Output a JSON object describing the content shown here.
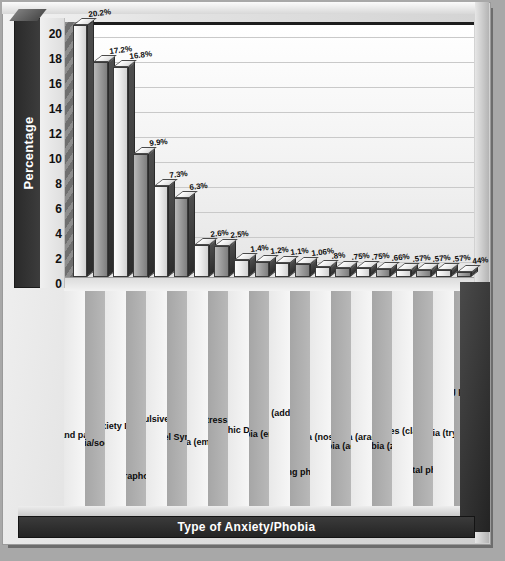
{
  "chart_data": {
    "type": "bar",
    "title": "",
    "xlabel": "Type of Anxiety/Phobia",
    "ylabel": "Percentage",
    "ylim": [
      0,
      21
    ],
    "yticks": [
      0,
      2,
      4,
      6,
      8,
      10,
      12,
      14,
      16,
      18,
      20
    ],
    "grid": true,
    "legend": "none",
    "categories": [
      "Panic attack and panic disorder",
      "Social phobia/social anxiety",
      "Generalized Anxiety Disorder (GAD)",
      "Agoraphobia",
      "Obsessive Compulsive Disorder (OCD)",
      "Irritable Bowel Syndrome (IBS)",
      "Vomit phobia (emetophobia)",
      "Post-Traumatic Stress Disorder (PTSD)",
      "Body Dysmorphic Disorder (BDD)",
      "Blushing phobia (erythrophobia)",
      "Tranquilizer issues (addiction/withdrawal)",
      "Driving phobia",
      "Illness phobia (nosemaphobia)",
      "Flying phobia (aerophobia)",
      "Spider phobia (arachnophobia)",
      "Animal phobia (zoophobia)",
      "Confined spaces (claustrophobia)",
      "Hospital phobia",
      "Injection phobia (trypanophobia)",
      "Choking and swallowing phobia (globus hystericus)"
    ],
    "values": [
      20.2,
      17.2,
      16.8,
      9.9,
      7.3,
      6.3,
      2.6,
      2.5,
      1.4,
      1.2,
      1.1,
      1.06,
      0.8,
      0.75,
      0.75,
      0.66,
      0.57,
      0.57,
      0.57,
      0.44
    ],
    "value_labels": [
      "20.2%",
      "17.2%",
      "16.8%",
      "9.9%",
      "7.3%",
      "6.3%",
      "2.6%",
      "2.5%",
      "1.4%",
      "1.2%",
      "1.1%",
      "1.06%",
      ".8%",
      ".75%",
      ".75%",
      ".66%",
      ".57%",
      ".57%",
      ".57%",
      "44%"
    ]
  },
  "colors": {
    "background": "#a8a8a8",
    "frame": "#e2e2e2",
    "axis_strip": "#2a2a2a",
    "bar_light": "#ededed",
    "bar_dark": "#9d9d9d",
    "text": "#0d0d0d"
  }
}
